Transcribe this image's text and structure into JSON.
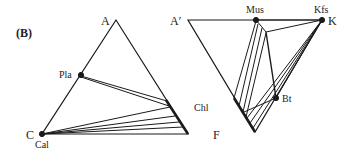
{
  "figure": {
    "panel_label": "(B)",
    "left_diagram": {
      "vertex_labels": {
        "top": "A",
        "bottom_left": "C",
        "bottom_right": "F"
      },
      "phase_labels": {
        "plagioclase": "Pla",
        "calcite": "Cal",
        "chlorite": "Chl"
      }
    },
    "right_diagram": {
      "vertex_labels": {
        "top_left": "A′",
        "top_right": "K",
        "bottom": "F"
      },
      "phase_labels": {
        "muscovite": "Mus",
        "k_feldspar": "Kfs",
        "biotite": "Bt"
      }
    },
    "colors": {
      "line": "#1a1a1a",
      "text": "#222222"
    }
  }
}
